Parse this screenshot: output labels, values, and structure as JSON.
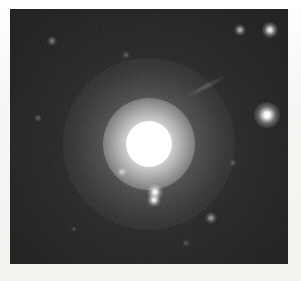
{
  "page": {
    "background_color": "#f6f5f3",
    "width": 301,
    "height": 281,
    "caption": ""
  },
  "plate": {
    "label": "astronomical-plate",
    "sky_color": "#2b2b2b",
    "frame": {
      "x": 10,
      "y": 9,
      "width": 278,
      "height": 255
    }
  },
  "objects": {
    "galaxy": {
      "name": "elliptical-galaxy",
      "cx": 149,
      "cy": 144,
      "core_radius": 23,
      "mid_halo_radius": 46,
      "outer_halo_radius": 86,
      "color": "#ffffff"
    },
    "companion_streak": {
      "name": "edge-on-companion-galaxy",
      "cx": 206,
      "cy": 86,
      "length": 46,
      "thickness": 7,
      "angle_deg": -28
    },
    "stars": [
      {
        "name": "star-bright-right",
        "cx": 267,
        "cy": 115,
        "radius": 5.0,
        "brightness": 1.0
      },
      {
        "name": "star-top-right-bright",
        "cx": 270,
        "cy": 30,
        "radius": 3.0,
        "brightness": 0.88
      },
      {
        "name": "star-top-right-faint",
        "cx": 240,
        "cy": 30,
        "radius": 2.4,
        "brightness": 0.62
      },
      {
        "name": "star-pair-upper",
        "cx": 155,
        "cy": 192,
        "radius": 3.0,
        "brightness": 0.96
      },
      {
        "name": "star-pair-lower",
        "cx": 154,
        "cy": 200,
        "radius": 2.8,
        "brightness": 0.92
      },
      {
        "name": "star-lower-right-faint",
        "cx": 211,
        "cy": 218,
        "radius": 2.2,
        "brightness": 0.5
      },
      {
        "name": "star-halo-left-faint",
        "cx": 122,
        "cy": 172,
        "radius": 2.0,
        "brightness": 0.55
      },
      {
        "name": "star-top-left-faint",
        "cx": 52,
        "cy": 41,
        "radius": 1.8,
        "brightness": 0.38
      },
      {
        "name": "star-mid-left-faint",
        "cx": 38,
        "cy": 118,
        "radius": 1.5,
        "brightness": 0.26
      },
      {
        "name": "star-upper-mid-faint",
        "cx": 126,
        "cy": 55,
        "radius": 1.5,
        "brightness": 0.24
      },
      {
        "name": "star-right-mid-faint",
        "cx": 233,
        "cy": 163,
        "radius": 1.4,
        "brightness": 0.22
      },
      {
        "name": "star-bottom-mid-faint",
        "cx": 186,
        "cy": 243,
        "radius": 1.4,
        "brightness": 0.2
      },
      {
        "name": "star-bottom-left-faint",
        "cx": 74,
        "cy": 229,
        "radius": 1.3,
        "brightness": 0.18
      }
    ]
  }
}
